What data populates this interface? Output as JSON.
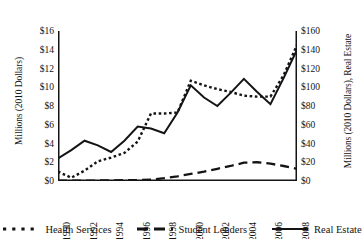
{
  "chart_data": {
    "type": "line",
    "title": "",
    "subtitle": "",
    "xlabel": "",
    "ylabel": "Millions (2010 Dollars)",
    "ylabel_secondary": "Millions (2010 Dollars), Real Estate",
    "grid": false,
    "legend_position": "bottom",
    "x": [
      1990,
      1991,
      1992,
      1993,
      1994,
      1995,
      1996,
      1997,
      1998,
      1999,
      2000,
      2001,
      2002,
      2003,
      2004,
      2005,
      2006,
      2007,
      2008
    ],
    "xtick_labels": [
      "1990",
      "1992",
      "1994",
      "1996",
      "1998",
      "2000",
      "2002",
      "2004",
      "2006",
      "2008"
    ],
    "xticks": [
      1990,
      1992,
      1994,
      1996,
      1998,
      2000,
      2002,
      2004,
      2006,
      2008
    ],
    "xlim": [
      1990,
      2008
    ],
    "ylim": [
      0,
      16
    ],
    "yticks": [
      0,
      2,
      4,
      6,
      8,
      10,
      12,
      14,
      16
    ],
    "ytick_labels": [
      "$0",
      "$2",
      "$4",
      "$6",
      "$8",
      "$10",
      "$12",
      "$14",
      "$16"
    ],
    "ylim_secondary": [
      0,
      160
    ],
    "yticks_secondary": [
      0,
      20,
      40,
      60,
      80,
      100,
      120,
      140,
      160
    ],
    "ytick_labels_secondary": [
      "$0",
      "$20",
      "$40",
      "$60",
      "$80",
      "$100",
      "$120",
      "$140",
      "$160"
    ],
    "series": [
      {
        "name": "Health Services",
        "axis": "left",
        "style": "dotted",
        "color": "#141414",
        "values": [
          1.0,
          0.35,
          1.1,
          2.1,
          2.5,
          3.0,
          4.2,
          7.2,
          7.2,
          7.3,
          10.7,
          10.2,
          9.8,
          9.5,
          9.1,
          9.0,
          9.0,
          11.3,
          14.5
        ]
      },
      {
        "name": "Student Lenders",
        "axis": "left",
        "style": "dashed",
        "color": "#141414",
        "values": [
          0.05,
          0.05,
          0.05,
          0.05,
          0.07,
          0.08,
          0.1,
          0.15,
          0.3,
          0.5,
          0.75,
          1.0,
          1.3,
          1.6,
          1.95,
          2.0,
          1.85,
          1.6,
          1.3
        ]
      },
      {
        "name": "Real Estate",
        "axis": "right",
        "style": "solid",
        "color": "#141414",
        "values": [
          24,
          33,
          43,
          38,
          31,
          43,
          58,
          56,
          51,
          73,
          102,
          89,
          80,
          94,
          109,
          95,
          82,
          110,
          140
        ]
      }
    ]
  },
  "legend": {
    "items": [
      {
        "label": "Health Services",
        "style": "dotted"
      },
      {
        "label": "Student Lenders",
        "style": "dashed"
      },
      {
        "label": "Real Estate",
        "style": "solid"
      }
    ]
  }
}
